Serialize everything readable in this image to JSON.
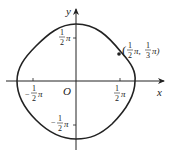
{
  "diagram": {
    "axes": {
      "x_label": "x",
      "y_label": "y",
      "origin_label": "O"
    },
    "ticks": {
      "x_positive": {
        "num": "1",
        "den": "2",
        "suffix": "π",
        "sign": ""
      },
      "x_negative": {
        "num": "1",
        "den": "2",
        "suffix": "π",
        "sign": "−"
      },
      "y_positive": {
        "num": "1",
        "den": "2",
        "suffix": "π",
        "sign": ""
      },
      "y_negative": {
        "num": "1",
        "den": "2",
        "suffix": "π",
        "sign": "−"
      }
    },
    "marked_point": {
      "open": "(",
      "x_num": "1",
      "x_den": "2",
      "sep": "π,",
      "y_num": "1",
      "y_den": "3",
      "close": "π)"
    },
    "colors": {
      "ink": "#222222"
    }
  }
}
